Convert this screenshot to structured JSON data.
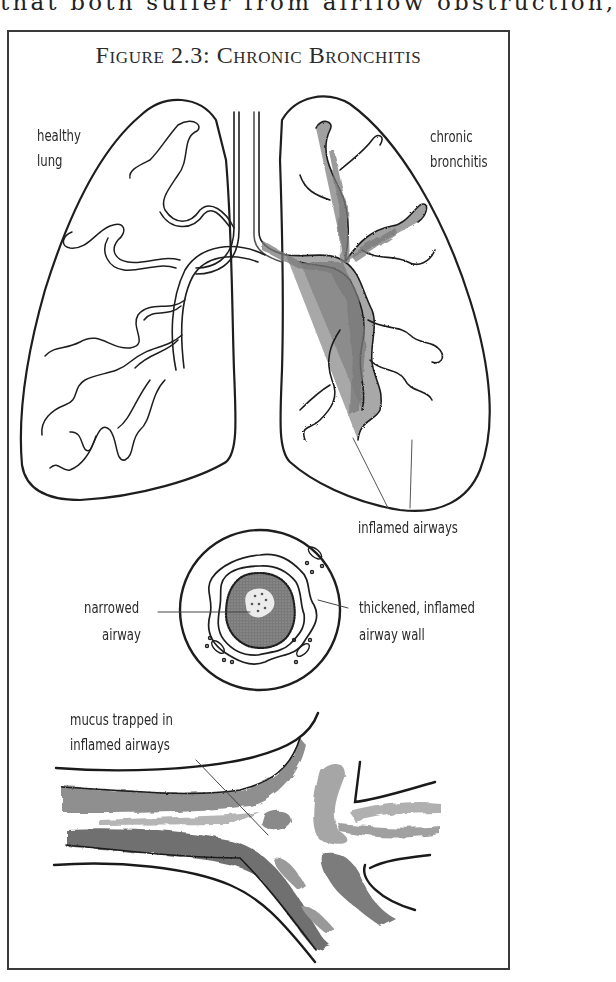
{
  "page": {
    "body_text_fragment": "that both suffer from airflow obstruction,"
  },
  "figure": {
    "title": "Figure 2.3: Chronic Bronchitis",
    "panels": [
      {
        "name": "lungs",
        "labels": {
          "left_lung": [
            "healthy",
            "lung"
          ],
          "right_lung": [
            "chronic",
            "bronchitis"
          ],
          "callout": "inflamed airways"
        }
      },
      {
        "name": "airway-cross-section",
        "labels": {
          "left": [
            "narrowed",
            "airway"
          ],
          "right": [
            "thickened, inflamed",
            "airway wall"
          ]
        }
      },
      {
        "name": "airway-branch-detail",
        "labels": {
          "callout": [
            "mucus trapped in",
            "inflamed airways"
          ]
        }
      }
    ]
  },
  "labels": {
    "healthy_1": "healthy",
    "healthy_2": "lung",
    "chronic_1": "chronic",
    "chronic_2": "bronchitis",
    "inflamed_airways": "inflamed airways",
    "narrowed_1": "narrowed",
    "narrowed_2": "airway",
    "thickened_1": "thickened, inflamed",
    "thickened_2": "airway wall",
    "mucus_1": "mucus trapped in",
    "mucus_2": "inflamed airways"
  },
  "colors": {
    "ink": "#1e1e1e",
    "frame": "#3a3a3a",
    "shade_dark": "#6a6a6a",
    "shade_mid": "#9a9a9a",
    "shade_light": "#c4c4c4"
  }
}
